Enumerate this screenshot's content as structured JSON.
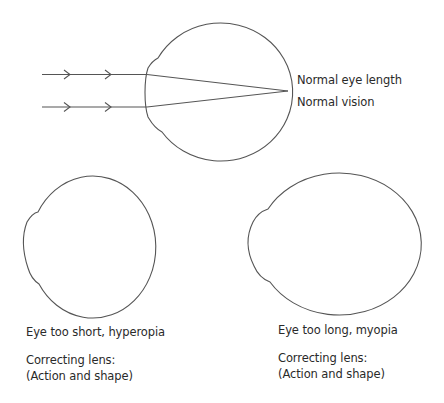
{
  "top_eye": {
    "label_length": "Normal eye length",
    "label_vision": "Normal vision"
  },
  "short_eye": {
    "label": "Eye too short, hyperopia",
    "lens_line1": "Correcting lens:",
    "lens_line2": "(Action and shape)"
  },
  "long_eye": {
    "label": "Eye too long, myopia",
    "lens_line1": "Correcting lens:",
    "lens_line2": "(Action and shape)"
  },
  "colors": {
    "stroke": "#555555",
    "text": "#2a2a2a",
    "background": "#ffffff"
  }
}
